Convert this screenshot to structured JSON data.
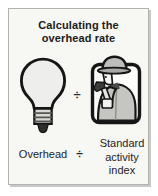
{
  "title": {
    "line1": "Calculating the",
    "line2": "overhead rate"
  },
  "formula": {
    "numerator_label": "Overhead",
    "divide_sign": "÷",
    "denominator_label": "Standard activity index",
    "numerator_icon": "lightbulb-icon",
    "denominator_icon": "worker-icon"
  },
  "colors": {
    "card_background": "#f7f7f4",
    "card_border": "#b2b2b0",
    "text": "#1b1b1b",
    "icon_outline": "#161616",
    "bulb_fill": "#eeeeec",
    "worker_gray": "#c5c5c2"
  }
}
